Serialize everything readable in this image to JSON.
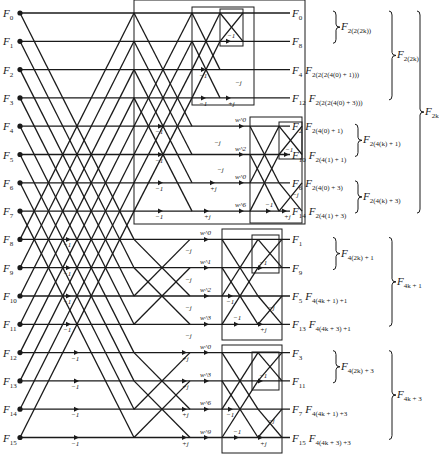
{
  "diagram": {
    "type": "FFT signal flow graph (16-point, split-radix decimation in frequency)",
    "inputs": [
      "F0",
      "F1",
      "F2",
      "F3",
      "F4",
      "F5",
      "F6",
      "F7",
      "F8",
      "F9",
      "F10",
      "F11",
      "F12",
      "F13",
      "F14",
      "F15"
    ],
    "input_labels": [
      {
        "base": "F",
        "sub": "0"
      },
      {
        "base": "F",
        "sub": "1"
      },
      {
        "base": "F",
        "sub": "2"
      },
      {
        "base": "F",
        "sub": "3"
      },
      {
        "base": "F",
        "sub": "4"
      },
      {
        "base": "F",
        "sub": "5"
      },
      {
        "base": "F",
        "sub": "6"
      },
      {
        "base": "F",
        "sub": "7"
      },
      {
        "base": "F",
        "sub": "8"
      },
      {
        "base": "F",
        "sub": "9"
      },
      {
        "base": "F",
        "sub": "10"
      },
      {
        "base": "F",
        "sub": "11"
      },
      {
        "base": "F",
        "sub": "12"
      },
      {
        "base": "F",
        "sub": "13"
      },
      {
        "base": "F",
        "sub": "14"
      },
      {
        "base": "F",
        "sub": "15"
      }
    ],
    "outputs": [
      {
        "base": "F",
        "sub": "0",
        "expr": ""
      },
      {
        "base": "F",
        "sub": "8",
        "expr": ""
      },
      {
        "base": "F",
        "sub": "4",
        "expr": "2(2(2(4(0) + 1)))"
      },
      {
        "base": "F",
        "sub": "12",
        "expr": "2(2(2(4(0) + 3)))"
      },
      {
        "base": "F",
        "sub": "2",
        "expr": "2(4(0) + 1)"
      },
      {
        "base": "F",
        "sub": "10",
        "expr": "2(4(1) + 1)"
      },
      {
        "base": "F",
        "sub": "6",
        "expr": "2(4(0) + 3)"
      },
      {
        "base": "F",
        "sub": "14",
        "expr": "2(4(1) + 3)"
      },
      {
        "base": "F",
        "sub": "1",
        "expr": ""
      },
      {
        "base": "F",
        "sub": "9",
        "expr": ""
      },
      {
        "base": "F",
        "sub": "5",
        "expr": "4(4k + 1) +1"
      },
      {
        "base": "F",
        "sub": "13",
        "expr": "4(4k + 3) +1"
      },
      {
        "base": "F",
        "sub": "3",
        "expr": ""
      },
      {
        "base": "F",
        "sub": "11",
        "expr": ""
      },
      {
        "base": "F",
        "sub": "7",
        "expr": "4(4k + 1) +3"
      },
      {
        "base": "F",
        "sub": "15",
        "expr": "4(4k + 3) +3"
      }
    ],
    "group_braces": [
      {
        "rows": [
          0,
          1
        ],
        "label_sub": "2(2(2k))",
        "level": 1
      },
      {
        "rows": [
          4,
          5
        ],
        "label_sub": "2(4(k) + 1)",
        "level": 1
      },
      {
        "rows": [
          6,
          7
        ],
        "label_sub": "2(4(k) + 3)",
        "level": 1
      },
      {
        "rows": [
          8,
          9
        ],
        "label_sub": "4(2k) + 1",
        "level": 1
      },
      {
        "rows": [
          12,
          13
        ],
        "label_sub": "4(2k) + 3",
        "level": 1
      },
      {
        "rows": [
          0,
          3
        ],
        "label_sub": "2(2k)",
        "level": 2
      },
      {
        "rows": [
          8,
          11
        ],
        "label_sub": "4k + 1",
        "level": 2
      },
      {
        "rows": [
          12,
          15
        ],
        "label_sub": "4k + 3",
        "level": 2
      },
      {
        "rows": [
          0,
          7
        ],
        "label_sub": "2k",
        "level": 3
      }
    ],
    "twiddles": {
      "stage2_upper": [
        "w^0",
        "w^2",
        "w^0",
        "w^6"
      ],
      "stage1_lower_a": [
        "w^0",
        "w^1",
        "w^2",
        "w^3"
      ],
      "stage1_lower_b": [
        "w^0",
        "w^3",
        "w^6",
        "w^9"
      ]
    },
    "branch_labels": {
      "minus_one": "−1",
      "minus_j": "−j",
      "plus_j": "+j"
    }
  }
}
